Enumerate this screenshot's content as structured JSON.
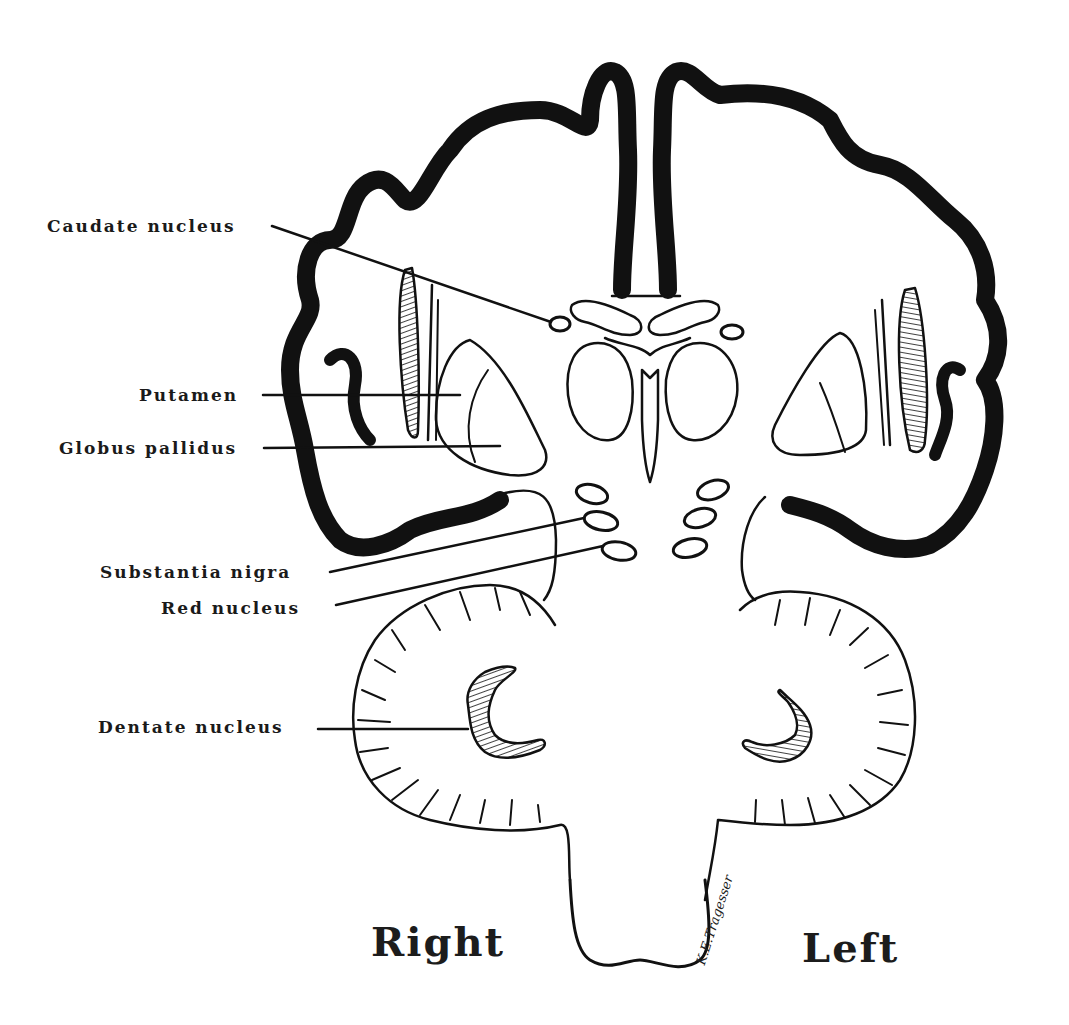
{
  "diagram": {
    "stroke_color": "#111111",
    "background": "#ffffff",
    "labels": [
      {
        "id": "caudate",
        "text": "Caudate nucleus"
      },
      {
        "id": "putamen",
        "text": "Putamen"
      },
      {
        "id": "globus",
        "text": "Globus pallidus"
      },
      {
        "id": "substantia",
        "text": "Substantia nigra"
      },
      {
        "id": "red",
        "text": "Red nucleus"
      },
      {
        "id": "dentate",
        "text": "Dentate nucleus"
      }
    ],
    "sides": {
      "right": "Right",
      "left": "Left"
    },
    "signature": "K.E.Tragesser"
  }
}
